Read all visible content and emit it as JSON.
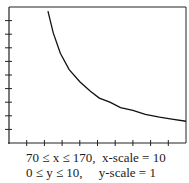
{
  "chart_data": {
    "type": "line",
    "title": "",
    "xlabel": "",
    "ylabel": "",
    "xlim": [
      70,
      170
    ],
    "ylim": [
      0,
      10
    ],
    "x_scale": 10,
    "y_scale": 1,
    "grid": false,
    "legend": null,
    "x_ticks": [
      80,
      90,
      100,
      110,
      120,
      130,
      140,
      150,
      160
    ],
    "y_ticks": [
      1,
      2,
      3,
      4,
      5,
      6,
      7,
      8,
      9
    ],
    "series": [
      {
        "name": "curve",
        "x": [
          92,
          95,
          99,
          104,
          110,
          116,
          121,
          127,
          133,
          140,
          147,
          155,
          162,
          170
        ],
        "y": [
          9.7,
          8.1,
          6.6,
          5.4,
          4.5,
          3.8,
          3.3,
          3.0,
          2.6,
          2.4,
          2.1,
          1.9,
          1.75,
          1.6
        ]
      }
    ],
    "window_text": [
      "70 ≤ x ≤ 170,  x-scale = 10",
      "0 ≤ y ≤ 10,     y-scale = 1"
    ]
  },
  "caption": {
    "line1": "70 ≤ x ≤ 170,  x-scale = 10",
    "line2": "0 ≤ y ≤ 10,     y-scale = 1"
  },
  "colors": {
    "axis": "#222222",
    "curve": "#111111"
  }
}
